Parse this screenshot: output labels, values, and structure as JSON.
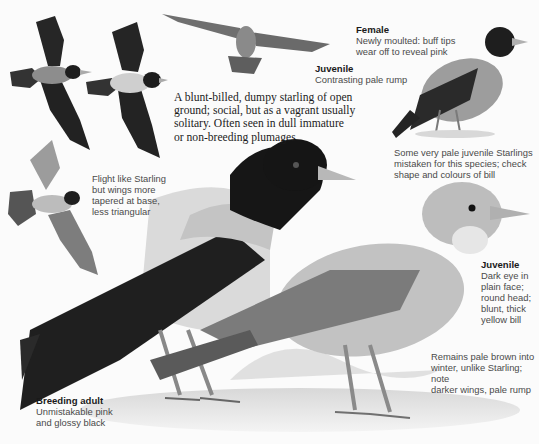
{
  "illustration": {
    "subject": "Rose-coloured Starling field guide plate",
    "palette": {
      "background": "#fbfbfb",
      "black_plumage": "#1c1c1c",
      "pale_body": "#c9c9c9",
      "juvenile_body": "#bdbdbd",
      "bill": "#b5b5b5"
    }
  },
  "intro_text": "A blunt-billed, dumpy starling of open\nground; social, but as a vagrant usually\nsolitary. Often seen in dull immature\nor non-breeding plumages",
  "labels": {
    "female": {
      "title": "Female",
      "text": "Newly moulted: buff tips\nwear off to reveal pink"
    },
    "juvenile_flight": {
      "title": "Juvenile",
      "text": "Contrasting pale rump"
    },
    "pale_starlings": {
      "text": "Some very pale juvenile Starlings\nmistaken for this species; check\nshape and colours of bill"
    },
    "flight": {
      "text": "Flight like Starling\nbut wings more\ntapered at base,\nless triangular"
    },
    "juvenile": {
      "title": "Juvenile",
      "text": "Dark eye in\nplain face;\nround head;\nblunt, thick\nyellow bill"
    },
    "winter": {
      "text": "Remains pale brown into\nwinter, unlike Starling; note\ndarker wings, pale rump"
    },
    "breeding_adult": {
      "title": "Breeding adult",
      "text": "Unmistakable pink\nand glossy black"
    }
  }
}
